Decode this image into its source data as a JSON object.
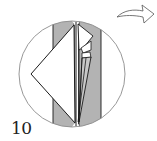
{
  "diagram": {
    "type": "origami-step",
    "step_number": "10",
    "colors": {
      "paper_colored": "#b3b3b3",
      "paper_white": "#ffffff",
      "outline": "#1a1a1a",
      "circle": "#8c8c8c",
      "arrow": "#555555"
    },
    "elements": {
      "detail_circle": "magnified-view-circle",
      "arrow": "curved-arrow-right",
      "left_flap": "white-triangular-flap",
      "center_pocket": "folded-pocket-layers",
      "strips": [
        "left-colored-strip",
        "right-colored-strip"
      ]
    }
  }
}
